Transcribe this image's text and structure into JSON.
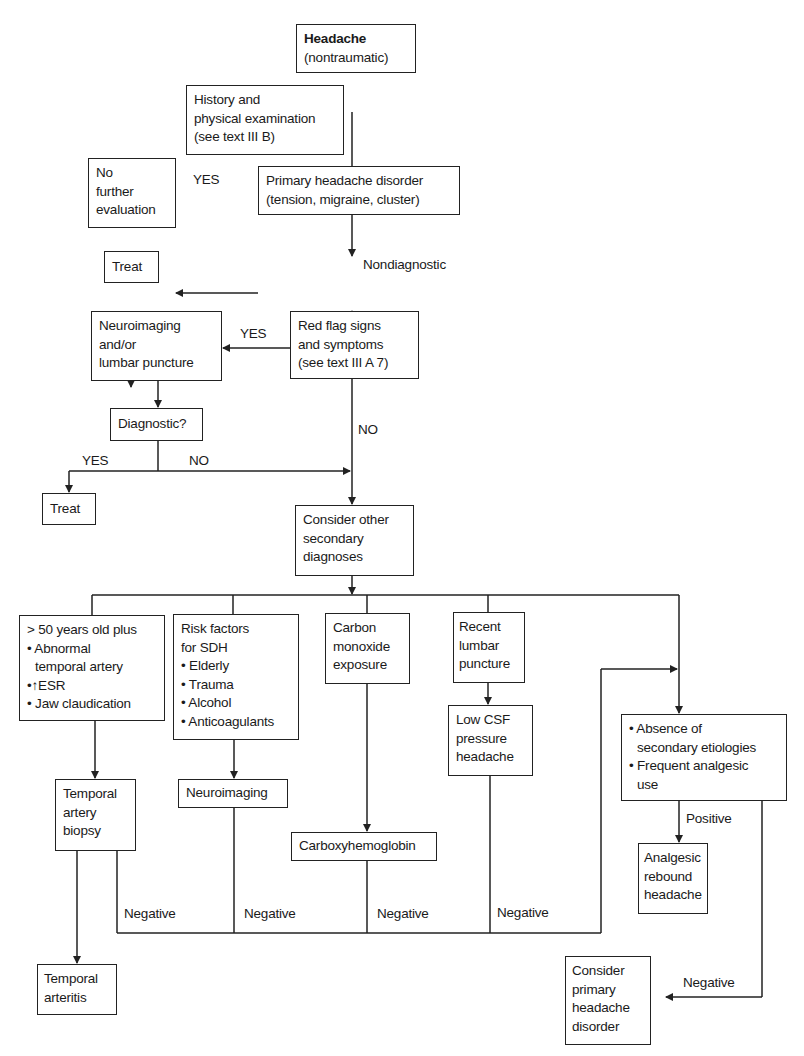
{
  "flowchart": {
    "start": {
      "title": "Headache",
      "subtitle": "(nontraumatic)"
    },
    "history": {
      "lines": [
        "History and",
        "physical examination",
        "(see text III B)"
      ]
    },
    "primary": {
      "lines": [
        "Primary headache disorder",
        "(tension, migraine, cluster)"
      ]
    },
    "no_further": {
      "lines": [
        "No",
        "further",
        "evaluation"
      ]
    },
    "treat_1": {
      "label": "Treat"
    },
    "red_flag": {
      "lines": [
        "Red flag signs",
        "and symptoms",
        "(see text III A 7)"
      ]
    },
    "neuro_lp": {
      "lines": [
        "Neuroimaging",
        "and/or",
        "lumbar puncture"
      ]
    },
    "diagnostic": {
      "label": "Diagnostic?"
    },
    "treat_2": {
      "label": "Treat"
    },
    "consider_secondary": {
      "lines": [
        "Consider other",
        "secondary",
        "diagnoses"
      ]
    },
    "branch_giant_cell": {
      "lines": [
        "> 50 years old plus",
        "• Abnormal",
        "temporal artery",
        "•↑ESR",
        "• Jaw claudication"
      ]
    },
    "branch_sdh": {
      "lines": [
        "Risk factors",
        "for SDH",
        "• Elderly",
        "• Trauma",
        "• Alcohol",
        "• Anticoagulants"
      ]
    },
    "branch_co": {
      "lines": [
        "Carbon",
        "monoxide",
        "exposure"
      ]
    },
    "branch_lp": {
      "lines": [
        "Recent",
        "lumbar",
        "puncture"
      ]
    },
    "branch_rebound": {
      "lines": [
        "• Absence of",
        "secondary etiologies",
        "• Frequent analgesic",
        "use"
      ]
    },
    "ta_biopsy": {
      "lines": [
        "Temporal",
        "artery",
        "biopsy"
      ]
    },
    "neuroimaging": {
      "label": "Neuroimaging"
    },
    "carboxy": {
      "label": "Carboxyhemoglobin"
    },
    "low_csf": {
      "lines": [
        "Low CSF",
        "pressure",
        "headache"
      ]
    },
    "analgesic_rebound": {
      "lines": [
        "Analgesic",
        "rebound",
        "headache"
      ]
    },
    "temporal_arteritis": {
      "lines": [
        "Temporal",
        "arteritis"
      ]
    },
    "consider_primary": {
      "lines": [
        "Consider",
        "primary",
        "headache",
        "disorder"
      ]
    },
    "edge_labels": {
      "yes_primary": "YES",
      "nondiagnostic": "Nondiagnostic",
      "yes_red_flag": "YES",
      "no_red_flag": "NO",
      "yes_diagnostic": "YES",
      "no_diagnostic": "NO",
      "negative_1": "Negative",
      "negative_2": "Negative",
      "negative_3": "Negative",
      "negative_4": "Negative",
      "positive": "Positive",
      "negative_right": "Negative"
    }
  }
}
